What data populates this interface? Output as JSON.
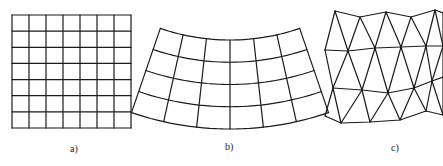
{
  "figure": {
    "panels": [
      {
        "id": "a",
        "label": "a)",
        "type": "structured-rectangular-grid",
        "cols": 7,
        "rows": 7,
        "bbox": [
          12,
          15,
          131,
          128
        ]
      },
      {
        "id": "b",
        "label": "b)",
        "type": "structured-curvilinear-grid",
        "cols": 6,
        "rows": 4
      },
      {
        "id": "c",
        "label": "c)",
        "type": "unstructured-triangular-mesh",
        "rows": [
          [
            [
              335,
              11
            ],
            [
              360,
              17
            ],
            [
              386,
              12
            ],
            [
              411,
              17
            ],
            [
              435,
              10
            ],
            [
              443,
              13
            ]
          ],
          [
            [
              325,
              50
            ],
            [
              348,
              51
            ],
            [
              375,
              48
            ],
            [
              401,
              47
            ],
            [
              426,
              46
            ],
            [
              443,
              46
            ]
          ],
          [
            [
              333,
              88
            ],
            [
              362,
              90
            ],
            [
              388,
              93
            ],
            [
              414,
              88
            ],
            [
              432,
              81
            ],
            [
              443,
              77
            ]
          ],
          [
            [
              325,
              116
            ],
            [
              341,
              123
            ],
            [
              370,
              122
            ],
            [
              400,
              120
            ],
            [
              426,
              111
            ],
            [
              443,
              115
            ]
          ]
        ]
      }
    ],
    "stroke_color": "#1a1a1a",
    "background": "#ffffff"
  }
}
